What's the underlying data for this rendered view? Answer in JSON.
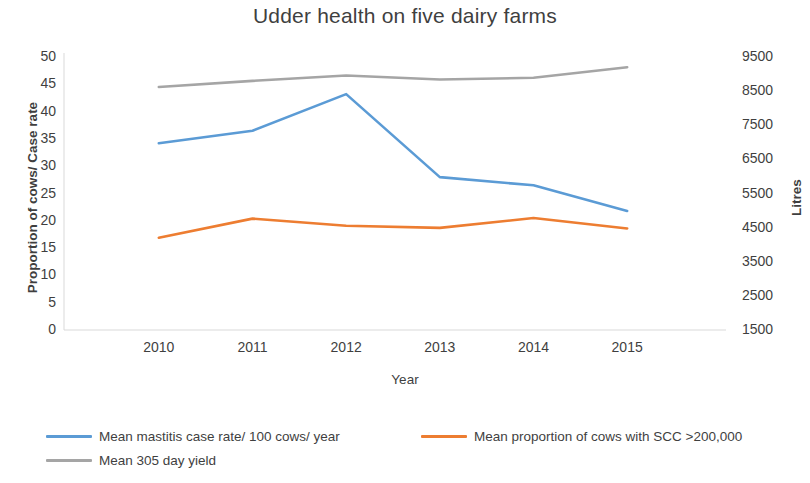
{
  "chart_data": {
    "type": "line",
    "title": "Udder health on five dairy farms",
    "xlabel": "Year",
    "ylabel": "Proportion of cows/ Case rate",
    "y2label": "Litres",
    "categories": [
      "2010",
      "2011",
      "2012",
      "2013",
      "2014",
      "2015"
    ],
    "x": [
      2010,
      2011,
      2012,
      2013,
      2014,
      2015
    ],
    "ylim": [
      0,
      50
    ],
    "y2lim": [
      1500,
      9500
    ],
    "yticks": [
      "50",
      "45",
      "40",
      "35",
      "30",
      "25",
      "20",
      "15",
      "10",
      "5",
      "0"
    ],
    "ytick_values": [
      50,
      45,
      40,
      35,
      30,
      25,
      20,
      15,
      10,
      5,
      0
    ],
    "y2ticks": [
      "9500",
      "8500",
      "7500",
      "6500",
      "5500",
      "4500",
      "3500",
      "2500",
      "1500"
    ],
    "y2tick_values": [
      9500,
      8500,
      7500,
      6500,
      5500,
      4500,
      3500,
      2500,
      1500
    ],
    "grid": false,
    "legend_position": "bottom",
    "series": [
      {
        "name": "Mean mastitis case rate/ 100 cows/ year",
        "axis": "left",
        "color": "#5B9BD5",
        "values": [
          34.2,
          36.5,
          43.2,
          28.0,
          26.5,
          21.8
        ]
      },
      {
        "name": "Mean proportion of cows with SCC >200,000",
        "axis": "left",
        "color": "#ED7D31",
        "values": [
          16.9,
          20.4,
          19.1,
          18.7,
          20.5,
          18.6
        ]
      },
      {
        "name": "Mean 305 day yield",
        "axis": "right",
        "color": "#A5A5A5",
        "values": [
          8620,
          8800,
          8960,
          8840,
          8890,
          9200
        ]
      }
    ]
  },
  "legend": {
    "items": [
      {
        "label": "Mean mastitis case rate/ 100 cows/ year",
        "color": "#5B9BD5"
      },
      {
        "label": "Mean proportion of cows with SCC >200,000",
        "color": "#ED7D31"
      },
      {
        "label": "Mean 305 day yield",
        "color": "#A5A5A5"
      }
    ]
  }
}
